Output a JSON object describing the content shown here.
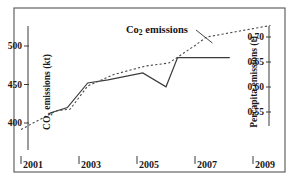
{
  "chart_data": {
    "type": "line",
    "title": "",
    "xlabel": "",
    "ylabel": "CO2 emissions (kt)",
    "y2label": "Percapita emissions (t)",
    "xlim": [
      2000.8,
      2009.8
    ],
    "ylim": [
      371,
      516
    ],
    "y2lim": [
      0.497,
      0.755
    ],
    "grid": false,
    "legend": "none",
    "x_ticks": [
      "2001",
      "2003",
      "2005",
      "2007",
      "2009"
    ],
    "x_tick_values": [
      2001,
      2003,
      2005,
      2007,
      2009
    ],
    "y_ticks": [
      "400",
      "450",
      "500"
    ],
    "y_tick_values": [
      400,
      450,
      500
    ],
    "y2_ticks": [
      "0.55",
      "0.60",
      "0.65",
      "0.70"
    ],
    "y2_tick_values": [
      0.55,
      0.6,
      0.65,
      0.7
    ],
    "series": [
      {
        "name": "CO2 emissions (kt)",
        "style": "solid",
        "axis": "left",
        "x": [
          2002.0,
          2002.6,
          2003.3,
          2004.0,
          2005.2,
          2006.0,
          2006.4,
          2008.2
        ],
        "values": [
          413,
          420,
          452,
          456,
          465,
          447,
          485,
          485
        ]
      },
      {
        "name": "Percapita emissions (t)",
        "style": "dashed",
        "axis": "right",
        "x": [
          2001.0,
          2002.2,
          2002.7,
          2003.3,
          2004.2,
          2005.3,
          2006.1,
          2007.0,
          2007.4,
          2009.6
        ],
        "values": [
          0.515,
          0.552,
          0.556,
          0.602,
          0.625,
          0.642,
          0.648,
          0.683,
          0.7,
          0.723
        ]
      }
    ],
    "annotations": [
      {
        "text": "Co2 emissions",
        "sub": "2",
        "target_x": 2007.6,
        "target_y2": 0.688
      }
    ],
    "colors": {
      "frame": "#555555",
      "solid_line": "#3a3a3a",
      "dashed_line": "#4a4a4a",
      "text": "#141414"
    }
  }
}
